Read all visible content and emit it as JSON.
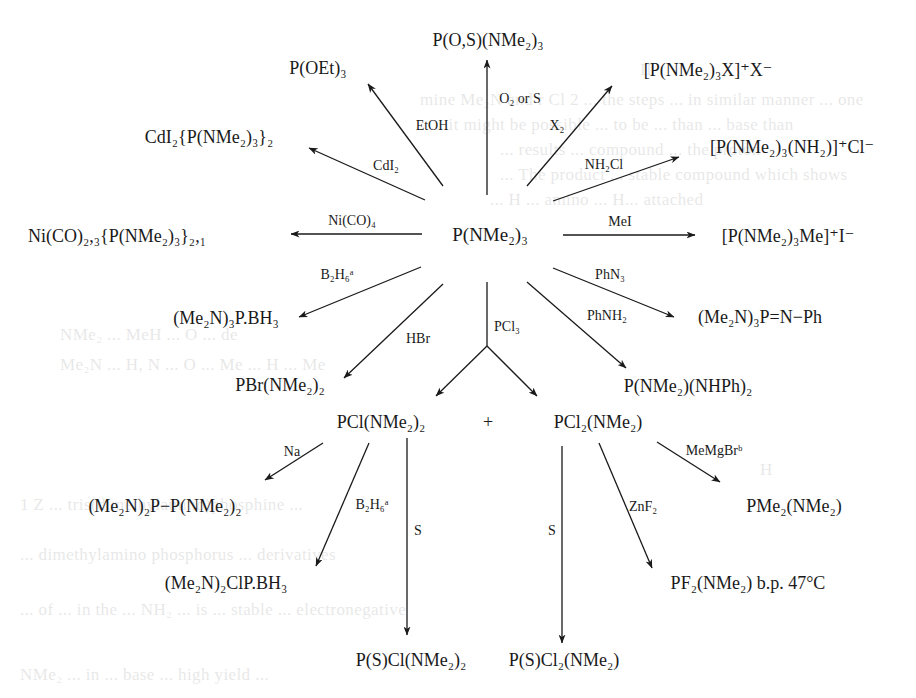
{
  "diagram": {
    "type": "reaction-scheme",
    "central_compound": "P(NMe₂)₃",
    "plus_sign": "+",
    "nodes": {
      "center": "P(NMe₂)₃",
      "p_os": "P(O,S)(NMe₂)₃",
      "p_oet": "P(OEt)₃",
      "phosphonium_x": "[P(NMe₂)₃X]⁺X⁻",
      "cdi2_complex": "CdI₂{P(NMe₂)₃}₂",
      "amino_phosphonium": "[P(NMe₂)₃(NH₂)]⁺Cl⁻",
      "ni_complex": "Ni(CO)₂,₃{P(NMe₂)₃}₂,₁",
      "methyl_phosphonium": "[P(NMe₂)₃Me]⁺I⁻",
      "borane_adduct": "(Me₂N)₃P.BH₃",
      "phosphinimine": "(Me₂N)₃P=N−Ph",
      "pbr": "PBr(NMe₂)₂",
      "anilino": "P(NMe₂)(NHPh)₂",
      "pcl": "PCl(NMe₂)₂",
      "pcl2": "PCl₂(NMe₂)",
      "diphosphine": "(Me₂N)₂P−P(NMe₂)₂",
      "pme2": "PMe₂(NMe₂)",
      "chloro_borane": "(Me₂N)₂ClP.BH₃",
      "pf2": "PF₂(NMe₂) b.p. 47°C",
      "ps_cl": "P(S)Cl(NMe₂)₂",
      "ps_cl2": "P(S)Cl₂(NMe₂)"
    },
    "reagents": {
      "o2_or_s": "O₂ or S",
      "etoh": "EtOH",
      "x2": "X₂",
      "cdi2": "CdI₂",
      "nh2cl": "NH₂Cl",
      "nico4": "Ni(CO)₄",
      "mei": "MeI",
      "b2h6_1": "B₂H₆ᵃ",
      "phn3": "PhN₃",
      "hbr": "HBr",
      "pcl3": "PCl₃",
      "phnh2": "PhNH₂",
      "na": "Na",
      "b2h6_2": "B₂H₆ᵃ",
      "s_1": "S",
      "s_2": "S",
      "memgbr": "MeMgBrᵇ",
      "znf2": "ZnF₂"
    },
    "reactions": [
      {
        "from": "P(NMe₂)₃",
        "reagent": "O₂ or S",
        "to": "P(O,S)(NMe₂)₃"
      },
      {
        "from": "P(NMe₂)₃",
        "reagent": "EtOH",
        "to": "P(OEt)₃"
      },
      {
        "from": "P(NMe₂)₃",
        "reagent": "X₂",
        "to": "[P(NMe₂)₃X]⁺X⁻"
      },
      {
        "from": "P(NMe₂)₃",
        "reagent": "CdI₂",
        "to": "CdI₂{P(NMe₂)₃}₂"
      },
      {
        "from": "P(NMe₂)₃",
        "reagent": "NH₂Cl",
        "to": "[P(NMe₂)₃(NH₂)]⁺Cl⁻"
      },
      {
        "from": "P(NMe₂)₃",
        "reagent": "Ni(CO)₄",
        "to": "Ni(CO)₂,₃{P(NMe₂)₃}₂,₁"
      },
      {
        "from": "P(NMe₂)₃",
        "reagent": "MeI",
        "to": "[P(NMe₂)₃Me]⁺I⁻"
      },
      {
        "from": "P(NMe₂)₃",
        "reagent": "B₂H₆ᵃ",
        "to": "(Me₂N)₃P.BH₃"
      },
      {
        "from": "P(NMe₂)₃",
        "reagent": "PhN₃",
        "to": "(Me₂N)₃P=N−Ph"
      },
      {
        "from": "P(NMe₂)₃",
        "reagent": "HBr",
        "to": "PBr(NMe₂)₂"
      },
      {
        "from": "P(NMe₂)₃",
        "reagent": "PhNH₂",
        "to": "P(NMe₂)(NHPh)₂"
      },
      {
        "from": "P(NMe₂)₃",
        "reagent": "PCl₃",
        "to": "PCl(NMe₂)₂ + PCl₂(NMe₂)"
      },
      {
        "from": "PCl(NMe₂)₂",
        "reagent": "Na",
        "to": "(Me₂N)₂P−P(NMe₂)₂"
      },
      {
        "from": "PCl(NMe₂)₂",
        "reagent": "B₂H₆ᵃ",
        "to": "(Me₂N)₂ClP.BH₃"
      },
      {
        "from": "PCl(NMe₂)₂",
        "reagent": "S",
        "to": "P(S)Cl(NMe₂)₂"
      },
      {
        "from": "PCl₂(NMe₂)",
        "reagent": "S",
        "to": "P(S)Cl₂(NMe₂)"
      },
      {
        "from": "PCl₂(NMe₂)",
        "reagent": "MeMgBrᵇ",
        "to": "PMe₂(NMe₂)"
      },
      {
        "from": "PCl₂(NMe₂)",
        "reagent": "ZnF₂",
        "to": "PF₂(NMe₂) b.p. 47°C"
      }
    ]
  },
  "colors": {
    "ink": "#1a1a1a",
    "paper": "#ffffff"
  }
}
